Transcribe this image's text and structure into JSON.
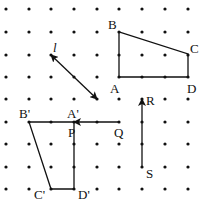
{
  "grid": {
    "xs": [
      6,
      29,
      51,
      74,
      97,
      119,
      142,
      165,
      188
    ],
    "ys": [
      9,
      32,
      55,
      77,
      99,
      122,
      144,
      167,
      189
    ],
    "dot_color": "#111111"
  },
  "figure_original": {
    "name": "ABCD",
    "vertices": {
      "A": [
        119,
        77
      ],
      "B": [
        119,
        32
      ],
      "C": [
        188,
        54
      ],
      "D": [
        188,
        77
      ]
    }
  },
  "figure_image": {
    "name": "A'B'C'D'",
    "vertices": {
      "A'": [
        74,
        122
      ],
      "B'": [
        29,
        122
      ],
      "C'": [
        51,
        189
      ],
      "D'": [
        74,
        189
      ]
    }
  },
  "line_l": {
    "from": [
      51,
      55
    ],
    "to": [
      97,
      99
    ],
    "arrows": "both"
  },
  "vector_QP": {
    "from": [
      120,
      122
    ],
    "to": [
      74,
      122
    ]
  },
  "vector_SR": {
    "from": [
      142,
      166
    ],
    "to": [
      142,
      99
    ]
  },
  "labels": {
    "l": "l",
    "A": "A",
    "B": "B",
    "C": "C",
    "D": "D",
    "A_prime": "A'",
    "B_prime": "B'",
    "C_prime": "C'",
    "D_prime": "D'",
    "P": "P",
    "Q": "Q",
    "R": "R",
    "S": "S"
  }
}
